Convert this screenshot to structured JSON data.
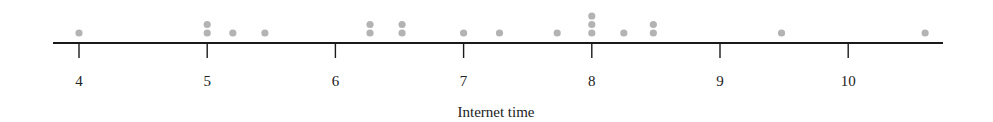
{
  "chart_data": {
    "type": "scatter",
    "subtype": "dot_plot",
    "title": "",
    "xlabel": "Internet time",
    "ylabel": "",
    "xlim": [
      3.8,
      10.75
    ],
    "ticks": [
      4,
      5,
      6,
      7,
      8,
      9,
      10
    ],
    "tick_labels": [
      "4",
      "5",
      "6",
      "7",
      "8",
      "9",
      "10"
    ],
    "grid": false,
    "legend": null,
    "dot_color": "#b3b3b3",
    "axis_color": "#1a1a1a",
    "points": [
      {
        "x": 4.0,
        "count": 1
      },
      {
        "x": 5.0,
        "count": 2
      },
      {
        "x": 5.2,
        "count": 1
      },
      {
        "x": 5.45,
        "count": 1
      },
      {
        "x": 6.27,
        "count": 2
      },
      {
        "x": 6.52,
        "count": 2
      },
      {
        "x": 7.0,
        "count": 1
      },
      {
        "x": 7.28,
        "count": 1
      },
      {
        "x": 7.73,
        "count": 1
      },
      {
        "x": 8.0,
        "count": 3
      },
      {
        "x": 8.25,
        "count": 1
      },
      {
        "x": 8.48,
        "count": 2
      },
      {
        "x": 9.48,
        "count": 1
      },
      {
        "x": 10.6,
        "count": 1
      }
    ],
    "values": [
      4.0,
      5.0,
      5.0,
      5.2,
      5.45,
      6.27,
      6.27,
      6.52,
      6.52,
      7.0,
      7.28,
      7.73,
      8.0,
      8.0,
      8.0,
      8.25,
      8.48,
      8.48,
      9.48,
      10.6
    ]
  }
}
